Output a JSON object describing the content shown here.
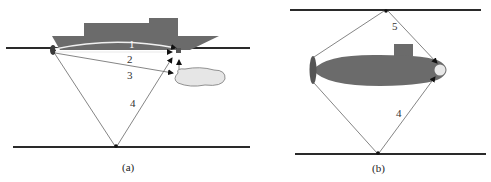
{
  "panels": [
    {
      "id": "a",
      "caption": "(a)",
      "description": "Surface ship with hull-mounted sensor; sound paths to receiver near stern",
      "path_labels": [
        "1",
        "2",
        "3",
        "4"
      ]
    },
    {
      "id": "b",
      "caption": "(b)",
      "description": "Submarine between surface and bottom; surface- and bottom-reflected paths to bow sensor",
      "path_labels": [
        "5",
        "4"
      ]
    }
  ],
  "colors": {
    "hull": "#6b6b6b",
    "boundary": "#2a2a2a",
    "ray": "#555555",
    "ray_direct": "#f0f0f0",
    "object": "#e6e6e6",
    "sensor": "#e8e8e8"
  }
}
